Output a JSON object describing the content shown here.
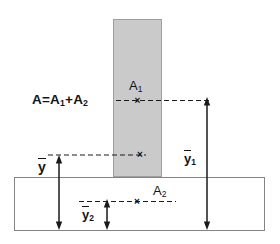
{
  "formula": {
    "p1": "A=A",
    "s1": "1",
    "p2": "+A",
    "s2": "2"
  },
  "labels": {
    "area1": {
      "base": "A",
      "sub": "1"
    },
    "area2": {
      "base": "A",
      "sub": "2"
    },
    "ybar": {
      "base": "y"
    },
    "ybar1": {
      "base": "y",
      "sub": "1"
    },
    "ybar2": {
      "base": "y",
      "sub": "2"
    }
  },
  "marks": {
    "glyph": "×"
  },
  "colors": {
    "area1_fill": "#cacaca",
    "area1_border": "#9e9e9e",
    "area2_fill": "#ffffff",
    "area2_border": "#848484",
    "line": "#1a1a1a",
    "background": "#ffffff"
  }
}
